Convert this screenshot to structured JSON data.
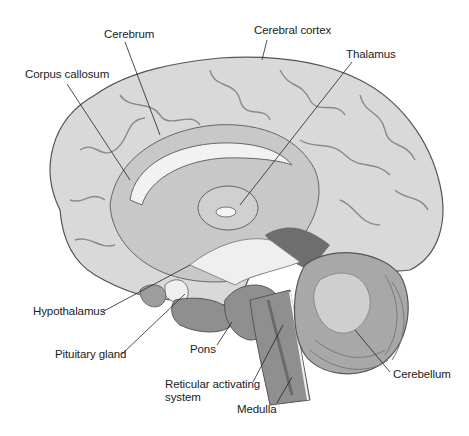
{
  "diagram": {
    "labels": {
      "cerebrum": "Cerebrum",
      "cerebral_cortex": "Cerebral cortex",
      "corpus_callosum": "Corpus callosum",
      "thalamus": "Thalamus",
      "hypothalamus": "Hypothalamus",
      "pituitary_gland": "Pituitary gland",
      "pons": "Pons",
      "reticular_line1": "Reticular activating",
      "reticular_line2": "system",
      "medulla": "Medulla",
      "cerebellum": "Cerebellum"
    },
    "colors": {
      "background": "#ffffff",
      "cortex": "#d9d9d9",
      "cortex_dark": "#9a9a9a",
      "inner": "#c8c8c8",
      "white_matter": "#f2f2f2",
      "brainstem": "#8f8f8f",
      "cerebellum": "#a8a8a8",
      "ventricle": "#6e6e6e",
      "leader_line": "#222222",
      "text": "#222222"
    }
  }
}
